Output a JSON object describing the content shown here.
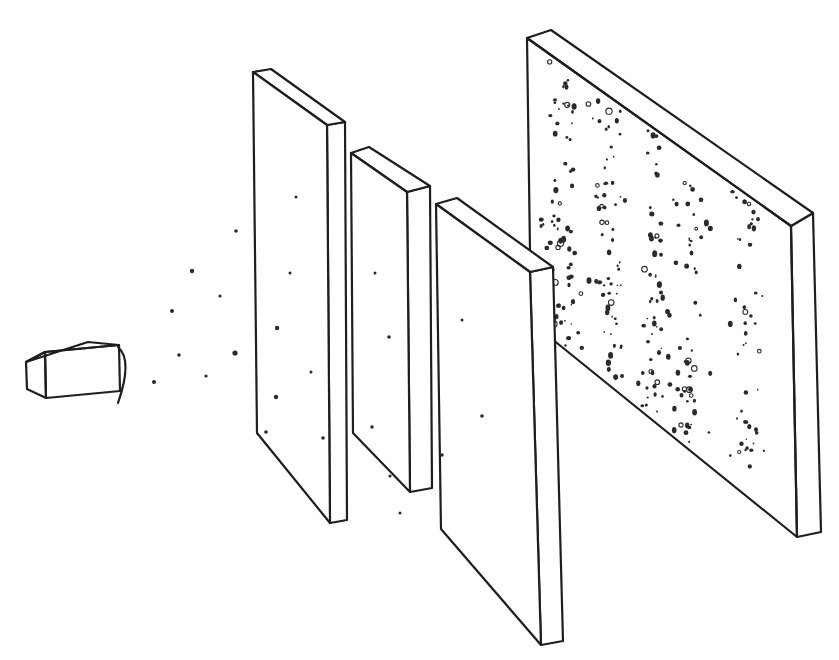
{
  "diagram": {
    "colors": {
      "ink": "#1e1e1e",
      "dot": "#2a2a2a",
      "background": "#ffffff"
    },
    "source": {
      "name": "emitter-box",
      "front": [
        [
          46,
          398
        ],
        [
          120,
          391
        ],
        [
          119,
          345
        ],
        [
          45,
          352
        ]
      ],
      "top": [
        [
          26,
          362
        ],
        [
          45,
          352
        ],
        [
          88,
          342
        ],
        [
          119,
          345
        ],
        [
          45,
          352
        ]
      ],
      "left": [
        [
          26,
          362
        ],
        [
          45,
          352
        ],
        [
          46,
          398
        ],
        [
          27,
          389
        ]
      ],
      "nozzle": "M118,347 Q133,360 118,403"
    },
    "panels": [
      {
        "name": "panel-1",
        "front": [
          [
            253,
            72
          ],
          [
            327,
            125
          ],
          [
            330,
            523
          ],
          [
            257,
            433
          ]
        ],
        "side": [
          [
            327,
            125
          ],
          [
            345,
            122
          ],
          [
            347,
            520
          ],
          [
            330,
            523
          ]
        ],
        "top": [
          [
            253,
            72
          ],
          [
            271,
            69
          ],
          [
            345,
            122
          ],
          [
            327,
            125
          ]
        ]
      },
      {
        "name": "panel-2",
        "front": [
          [
            351,
            153
          ],
          [
            407,
            192
          ],
          [
            410,
            492
          ],
          [
            353,
            433
          ]
        ],
        "side": [
          [
            407,
            192
          ],
          [
            430,
            186
          ],
          [
            432,
            488
          ],
          [
            410,
            492
          ]
        ],
        "top": [
          [
            351,
            153
          ],
          [
            369,
            147
          ],
          [
            430,
            186
          ],
          [
            407,
            192
          ]
        ]
      },
      {
        "name": "panel-3",
        "front": [
          [
            436,
            204
          ],
          [
            530,
            272
          ],
          [
            541,
            645
          ],
          [
            441,
            529
          ]
        ],
        "side": [
          [
            530,
            272
          ],
          [
            553,
            267
          ],
          [
            563,
            641
          ],
          [
            541,
            645
          ]
        ],
        "top": [
          [
            436,
            204
          ],
          [
            457,
            198
          ],
          [
            553,
            267
          ],
          [
            530,
            272
          ]
        ]
      },
      {
        "name": "detector-screen",
        "front": [
          [
            527,
            38
          ],
          [
            791,
            226
          ],
          [
            797,
            537
          ],
          [
            531,
            322
          ]
        ],
        "side": [
          [
            791,
            226
          ],
          [
            813,
            213
          ],
          [
            821,
            532
          ],
          [
            797,
            537
          ]
        ],
        "top": [
          [
            527,
            38
          ],
          [
            551,
            30
          ],
          [
            813,
            213
          ],
          [
            791,
            226
          ]
        ]
      }
    ],
    "particles_in_flight": [
      [
        236,
        231,
        1.8
      ],
      [
        192,
        271,
        2.2
      ],
      [
        220,
        296,
        1.6
      ],
      [
        172,
        311,
        2.0
      ],
      [
        179,
        355,
        1.8
      ],
      [
        235,
        353,
        2.6
      ],
      [
        206,
        376,
        1.6
      ],
      [
        154,
        382,
        2.0
      ],
      [
        266,
        432,
        1.8
      ],
      [
        323,
        438,
        1.8
      ],
      [
        296,
        197,
        1.5
      ],
      [
        290,
        273,
        1.5
      ],
      [
        277,
        328,
        2.2
      ],
      [
        311,
        372,
        1.5
      ],
      [
        276,
        397,
        2.2
      ],
      [
        375,
        273,
        1.5
      ],
      [
        389,
        337,
        1.8
      ],
      [
        372,
        427,
        1.8
      ],
      [
        400,
        513,
        1.5
      ],
      [
        462,
        320,
        1.5
      ],
      [
        482,
        416,
        1.8
      ],
      [
        442,
        455,
        1.8
      ],
      [
        390,
        476,
        1.6
      ]
    ],
    "screen_bands_x": [
      562,
      609,
      655,
      690,
      745
    ],
    "screen_seed": 7
  }
}
